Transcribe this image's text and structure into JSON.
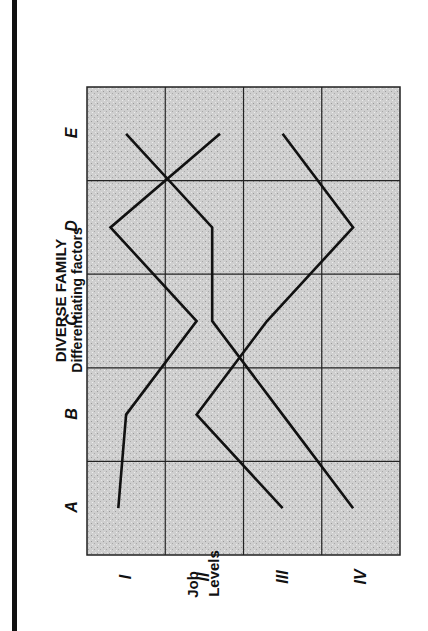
{
  "title": "DIVERSE FAMILY",
  "subtitle": "Differentiating factors",
  "y_axis_title_line1": "Job",
  "y_axis_title_line2": "Levels",
  "factors": [
    "A",
    "B",
    "C",
    "D",
    "E"
  ],
  "levels": [
    "I",
    "II",
    "III",
    "IV"
  ],
  "colors": {
    "grid_fill": "#c9c9c9",
    "grid_line": "#222222",
    "series_line": "#111111",
    "spine": "#111111"
  },
  "chart_data": {
    "type": "line",
    "title": "DIVERSE FAMILY",
    "subtitle": "Differentiating factors",
    "orientation": "rotated 90° counter-clockwise",
    "x": [
      "A",
      "B",
      "C",
      "D",
      "E"
    ],
    "xlabel": "Differentiating factors",
    "ylabel": "Job Levels",
    "y_categories": [
      "I",
      "II",
      "III",
      "IV"
    ],
    "y_note": "1 = I (top), 4 = IV (bottom)",
    "ylim": [
      0.5,
      4.5
    ],
    "grid": true,
    "legend": null,
    "series": [
      {
        "name": "Line 1",
        "values": [
          0.9,
          1.0,
          1.9,
          0.8,
          2.2
        ]
      },
      {
        "name": "Line 2",
        "values": [
          3.9,
          3.0,
          2.1,
          2.1,
          1.0
        ]
      },
      {
        "name": "Line 3",
        "values": [
          3.0,
          1.9,
          2.8,
          3.9,
          3.0
        ]
      }
    ]
  }
}
